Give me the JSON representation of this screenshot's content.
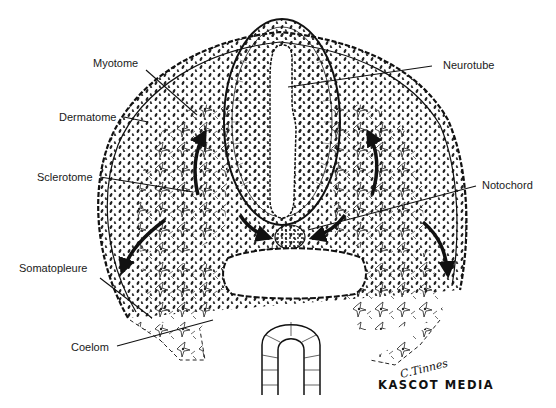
{
  "figure": {
    "labels": {
      "myotome": "Myotome",
      "dermatome": "Dermatome",
      "sclerotome": "Sclerotome",
      "somatopleure": "Somatopleure",
      "coelom": "Coelom",
      "neurotube": "Neurotube",
      "notochord": "Notochord"
    },
    "signature": "C.Tinnes",
    "credit": "KASCOT MEDIA",
    "colors": {
      "ink": "#111111",
      "background": "#ffffff"
    }
  }
}
